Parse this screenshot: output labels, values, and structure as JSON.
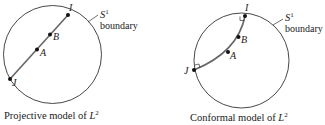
{
  "figures": [
    {
      "caption": "Projective model of ",
      "caption_var": "L",
      "caption_sup": "2",
      "boundary_symbol": "S",
      "boundary_sup": "1",
      "boundary_label": "boundary",
      "points": {
        "I": "I",
        "B": "B",
        "A": "A",
        "J": "J"
      },
      "geodesic_type": "straight chord"
    },
    {
      "caption": "Conformal model of ",
      "caption_var": "L",
      "caption_sup": "2",
      "boundary_symbol": "S",
      "boundary_sup": "1",
      "boundary_label": "boundary",
      "points": {
        "I": "I",
        "B": "B",
        "A": "A",
        "J": "J"
      },
      "geodesic_type": "circular arc orthogonal to boundary"
    }
  ],
  "colors": {
    "ink": "#1a1a1a",
    "line": "#555555",
    "background": "#ffffff"
  }
}
